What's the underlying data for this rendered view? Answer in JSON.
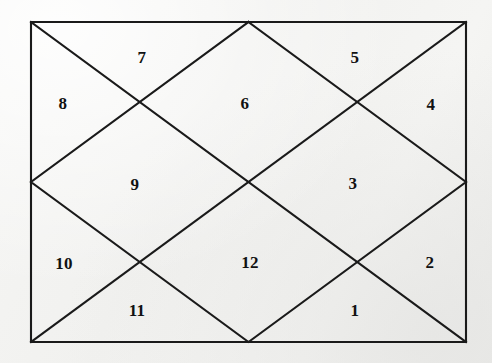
{
  "diagram": {
    "type": "north-indian-kundli",
    "background_color": "#f3f3f1",
    "line_color": "#1a1a1a",
    "text_color": "#111111",
    "outer_rect": {
      "x": 31,
      "y": 22,
      "width": 435,
      "height": 320
    },
    "center": {
      "x": 248.5,
      "y": 182
    },
    "lines": [
      {
        "name": "outer-border",
        "points": "31,22 466,22 466,342 31,342 31,22"
      },
      {
        "name": "diagonal-tl-br",
        "points": "31,22 466,342"
      },
      {
        "name": "diagonal-tr-bl",
        "points": "466,22 31,342"
      },
      {
        "name": "inner-diamond",
        "points": "248.5,22 466,182 248.5,342 31,182 248.5,22"
      }
    ],
    "houses": [
      {
        "number": "1",
        "label_x": 355,
        "label_y": 310
      },
      {
        "number": "2",
        "label_x": 430,
        "label_y": 262
      },
      {
        "number": "3",
        "label_x": 353,
        "label_y": 183
      },
      {
        "number": "4",
        "label_x": 431,
        "label_y": 104
      },
      {
        "number": "5",
        "label_x": 355,
        "label_y": 57
      },
      {
        "number": "6",
        "label_x": 245,
        "label_y": 103
      },
      {
        "number": "7",
        "label_x": 142,
        "label_y": 57
      },
      {
        "number": "8",
        "label_x": 63,
        "label_y": 103
      },
      {
        "number": "9",
        "label_x": 135,
        "label_y": 184
      },
      {
        "number": "10",
        "label_x": 64,
        "label_y": 263
      },
      {
        "number": "11",
        "label_x": 137,
        "label_y": 310
      },
      {
        "number": "12",
        "label_x": 250,
        "label_y": 262
      }
    ]
  }
}
